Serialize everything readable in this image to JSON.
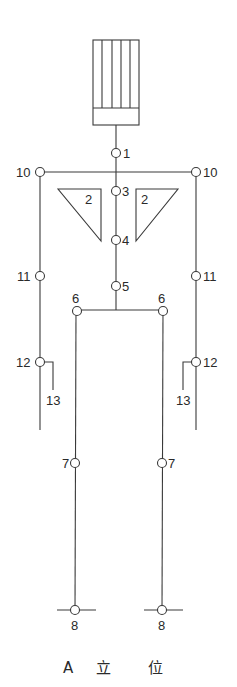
{
  "diagram": {
    "caption": {
      "letter": "A",
      "char1": "立",
      "char2": "位"
    },
    "labels": {
      "n1": "1",
      "n2_left": "2",
      "n2_right": "2",
      "n3": "3",
      "n4": "4",
      "n5": "5",
      "n6_left": "6",
      "n6_right": "6",
      "n7_left": "7",
      "n7_right": "7",
      "n8_left": "8",
      "n8_right": "8",
      "n10_left": "10",
      "n10_right": "10",
      "n11_left": "11",
      "n11_right": "11",
      "n12_left": "12",
      "n12_right": "12",
      "n13_left": "13",
      "n13_right": "13"
    },
    "colors": {
      "line": "#3a3a3a",
      "background": "#ffffff"
    }
  }
}
